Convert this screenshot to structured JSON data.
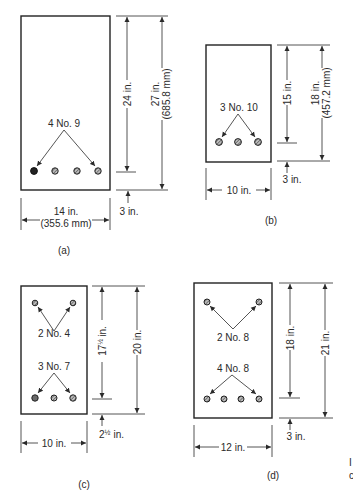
{
  "figure": {
    "sections": [
      {
        "id": "a",
        "caption": "(a)",
        "width_label": "14 in.",
        "width_label_mm": "(355.6 mm)",
        "effective_depth_label": "24 in.",
        "total_depth_label": "27 in.",
        "total_depth_label_mm": "(685.8 mm)",
        "cover_label": "3 in.",
        "bottom_bars_label": "4 No. 9",
        "bottom_bar_count": 4
      },
      {
        "id": "b",
        "caption": "(b)",
        "width_label": "10 in.",
        "effective_depth_label": "15 in.",
        "total_depth_label": "18 in.",
        "total_depth_label_mm": "(457.2 mm)",
        "cover_label": "3 in.",
        "bottom_bars_label": "3 No. 10",
        "bottom_bar_count": 3
      },
      {
        "id": "c",
        "caption": "(c)",
        "width_label": "10 in.",
        "effective_depth_label": "17½ in.",
        "effective_depth_whole": "17",
        "effective_depth_frac": "½",
        "effective_depth_unit": "in.",
        "total_depth_label": "20 in.",
        "cover_label": "2½ in.",
        "cover_whole": "2",
        "cover_frac": "½",
        "cover_unit": "in.",
        "top_bars_label": "2 No. 4",
        "top_bar_count": 2,
        "bottom_bars_label": "3 No. 7",
        "bottom_bar_count": 3
      },
      {
        "id": "d",
        "caption": "(d)",
        "width_label": "12 in.",
        "effective_depth_label": "18 in.",
        "total_depth_label": "21 in.",
        "cover_label": "3 in.",
        "top_bars_label": "2 No. 8",
        "top_bar_count": 2,
        "bottom_bars_label": "4 No. 8",
        "bottom_bar_count": 4
      }
    ],
    "edge_fragments": [
      "I",
      "c"
    ]
  }
}
